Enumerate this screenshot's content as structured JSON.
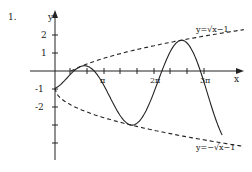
{
  "problem_number": "1.",
  "axes": {
    "x_label": "x",
    "y_label": "y",
    "x_ticks": [
      {
        "label": "",
        "px": 70
      },
      {
        "label": "",
        "px": 87
      },
      {
        "label": "π",
        "px": 104
      },
      {
        "label": "",
        "px": 120
      },
      {
        "label": "",
        "px": 137
      },
      {
        "label": "2π",
        "px": 154
      },
      {
        "label": "",
        "px": 170
      },
      {
        "label": "",
        "px": 187
      },
      {
        "label": "3π",
        "px": 204
      }
    ],
    "y_ticks": [
      {
        "label": "2",
        "py": 35
      },
      {
        "label": "1",
        "py": 53
      },
      {
        "label": "-1",
        "py": 89
      },
      {
        "label": "-2",
        "py": 107
      },
      {
        "label": "",
        "py": 125
      },
      {
        "label": "",
        "py": 143
      }
    ]
  },
  "curves": {
    "upper_label": "y=√x−1",
    "lower_label": "y=−√x−1",
    "main": "y=√x·sin x − 1"
  },
  "colors": {
    "ink": "#222222",
    "background": "#ffffff"
  },
  "chart_data": {
    "type": "line",
    "title": "",
    "xlabel": "x",
    "ylabel": "y",
    "x_tick_labels": [
      "π",
      "2π",
      "3π"
    ],
    "y_tick_labels": [
      "2",
      "1",
      "-1",
      "-2"
    ],
    "series": [
      {
        "name": "y=√x sin x − 1 (solid)",
        "style": "solid",
        "points": [
          [
            0,
            -1
          ],
          [
            0.6,
            -0.2
          ],
          [
            1.9,
            -1.2
          ],
          [
            3.4,
            -2.7
          ],
          [
            4.7,
            -1
          ],
          [
            6.3,
            1.5
          ],
          [
            7.6,
            0
          ],
          [
            9.4,
            -4.1
          ],
          [
            10.5,
            -0.9
          ]
        ]
      },
      {
        "name": "y=√x−1 (dashed)",
        "style": "dashed",
        "points": [
          [
            1,
            0
          ],
          [
            3.14,
            0.77
          ],
          [
            6.28,
            1.5
          ],
          [
            9.42,
            2.07
          ],
          [
            11.7,
            2.42
          ]
        ]
      },
      {
        "name": "y=−√x−1 (dashed)",
        "style": "dashed",
        "points": [
          [
            0,
            -1
          ],
          [
            3.14,
            -2.77
          ],
          [
            6.28,
            -3.5
          ],
          [
            9.42,
            -4.07
          ],
          [
            11.7,
            -4.42
          ]
        ]
      }
    ],
    "xlim": [
      -1,
      12
    ],
    "ylim": [
      -5,
      3
    ],
    "grid": false,
    "legend": "inline annotations"
  }
}
